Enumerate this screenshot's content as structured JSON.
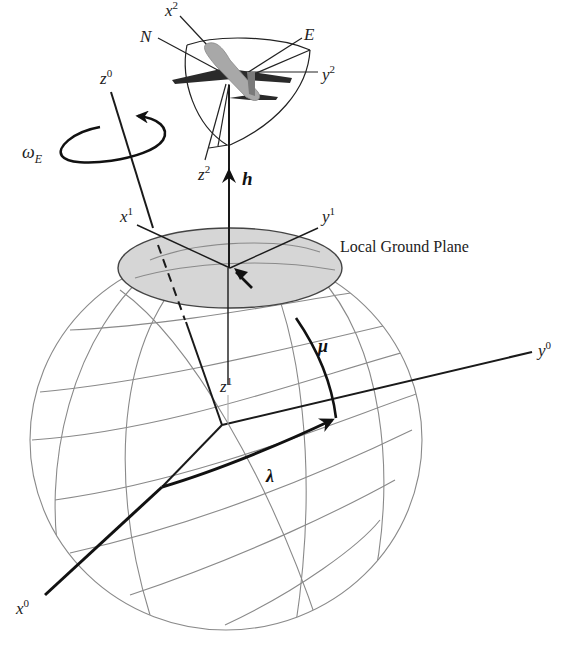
{
  "figure": {
    "type": "earth-frame-geometry-diagram",
    "colors": {
      "background": "#ffffff",
      "axes": "#1a1a1a",
      "sphere_grid": "#8a8a8a",
      "ground_plane_fill": "#d6d6d6",
      "ground_plane_edge": "#444444",
      "aircraft_body": "#a8a8a8",
      "aircraft_wings": "#2a2a2a"
    },
    "labels": {
      "local_ground_plane": "Local Ground Plane",
      "earth_rate": {
        "base": "ω",
        "sub": "E"
      },
      "h": "h",
      "mu": "μ",
      "lambda": "λ",
      "north": "N",
      "east": "E"
    },
    "frames": {
      "frame0": {
        "name": "Earth-centered frame",
        "x": {
          "base": "x",
          "sup": "0"
        },
        "y": {
          "base": "y",
          "sup": "0"
        },
        "z": {
          "base": "z",
          "sup": "0"
        }
      },
      "frame1": {
        "name": "Local ground frame",
        "x": {
          "base": "x",
          "sup": "1"
        },
        "y": {
          "base": "y",
          "sup": "1"
        },
        "z": {
          "base": "z",
          "sup": "1"
        }
      },
      "frame2": {
        "name": "Aircraft body frame",
        "x": {
          "base": "x",
          "sup": "2"
        },
        "y": {
          "base": "y",
          "sup": "2"
        },
        "z": {
          "base": "z",
          "sup": "2"
        }
      }
    }
  }
}
